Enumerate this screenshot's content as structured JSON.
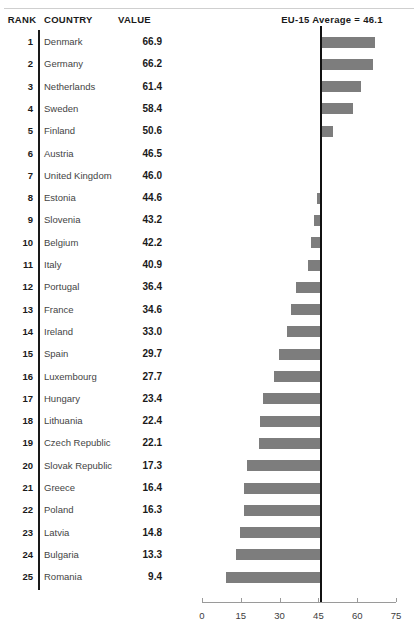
{
  "header": {
    "rank_label": "RANK",
    "country_label": "COUNTRY",
    "value_label": "VALUE",
    "average_label": "EU-15 Average = 46.1"
  },
  "chart_data": {
    "type": "bar",
    "orientation": "horizontal",
    "title": "",
    "subtitle": "",
    "xlabel": "",
    "ylabel": "",
    "xlim": [
      0,
      75
    ],
    "baseline": 46.1,
    "baseline_label": "EU-15 Average = 46.1",
    "grid": false,
    "legend": null,
    "bar_color": "#7d7d7d",
    "baseline_color": "#111111",
    "xticks": [
      0,
      15,
      30,
      45,
      60,
      75
    ],
    "xtick_labels": [
      "0",
      "15",
      "30",
      "45",
      "60",
      "75"
    ],
    "columns": [
      "RANK",
      "COUNTRY",
      "VALUE"
    ],
    "categories": [
      "Denmark",
      "Germany",
      "Netherlands",
      "Sweden",
      "Finland",
      "Austria",
      "United Kingdom",
      "Estonia",
      "Slovenia",
      "Belgium",
      "Italy",
      "Portugal",
      "France",
      "Ireland",
      "Spain",
      "Luxembourg",
      "Hungary",
      "Lithuania",
      "Czech Republic",
      "Slovak Republic",
      "Greece",
      "Poland",
      "Latvia",
      "Bulgaria",
      "Romania"
    ],
    "values": [
      66.9,
      66.2,
      61.4,
      58.4,
      50.6,
      46.5,
      46.0,
      44.6,
      43.2,
      42.2,
      40.9,
      36.4,
      34.6,
      33.0,
      29.7,
      27.7,
      23.4,
      22.4,
      22.1,
      17.3,
      16.4,
      16.3,
      14.8,
      13.3,
      9.4
    ],
    "rows": [
      {
        "rank": "1",
        "country": "Denmark",
        "value": "66.9",
        "num": 66.9
      },
      {
        "rank": "2",
        "country": "Germany",
        "value": "66.2",
        "num": 66.2
      },
      {
        "rank": "3",
        "country": "Netherlands",
        "value": "61.4",
        "num": 61.4
      },
      {
        "rank": "4",
        "country": "Sweden",
        "value": "58.4",
        "num": 58.4
      },
      {
        "rank": "5",
        "country": "Finland",
        "value": "50.6",
        "num": 50.6
      },
      {
        "rank": "6",
        "country": "Austria",
        "value": "46.5",
        "num": 46.5
      },
      {
        "rank": "7",
        "country": "United Kingdom",
        "value": "46.0",
        "num": 46.0
      },
      {
        "rank": "8",
        "country": "Estonia",
        "value": "44.6",
        "num": 44.6
      },
      {
        "rank": "9",
        "country": "Slovenia",
        "value": "43.2",
        "num": 43.2
      },
      {
        "rank": "10",
        "country": "Belgium",
        "value": "42.2",
        "num": 42.2
      },
      {
        "rank": "11",
        "country": "Italy",
        "value": "40.9",
        "num": 40.9
      },
      {
        "rank": "12",
        "country": "Portugal",
        "value": "36.4",
        "num": 36.4
      },
      {
        "rank": "13",
        "country": "France",
        "value": "34.6",
        "num": 34.6
      },
      {
        "rank": "14",
        "country": "Ireland",
        "value": "33.0",
        "num": 33.0
      },
      {
        "rank": "15",
        "country": "Spain",
        "value": "29.7",
        "num": 29.7
      },
      {
        "rank": "16",
        "country": "Luxembourg",
        "value": "27.7",
        "num": 27.7
      },
      {
        "rank": "17",
        "country": "Hungary",
        "value": "23.4",
        "num": 23.4
      },
      {
        "rank": "18",
        "country": "Lithuania",
        "value": "22.4",
        "num": 22.4
      },
      {
        "rank": "19",
        "country": "Czech Republic",
        "value": "22.1",
        "num": 22.1
      },
      {
        "rank": "20",
        "country": "Slovak Republic",
        "value": "17.3",
        "num": 17.3
      },
      {
        "rank": "21",
        "country": "Greece",
        "value": "16.4",
        "num": 16.4
      },
      {
        "rank": "22",
        "country": "Poland",
        "value": "16.3",
        "num": 16.3
      },
      {
        "rank": "23",
        "country": "Latvia",
        "value": "14.8",
        "num": 14.8
      },
      {
        "rank": "24",
        "country": "Bulgaria",
        "value": "13.3",
        "num": 13.3
      },
      {
        "rank": "25",
        "country": "Romania",
        "value": "9.4",
        "num": 9.4
      }
    ]
  }
}
